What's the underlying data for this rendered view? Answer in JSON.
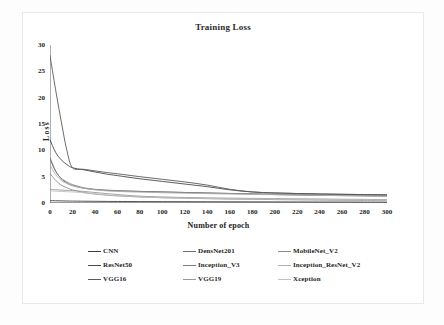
{
  "chart_data": {
    "type": "line",
    "title": "Training Loss",
    "xlabel": "Number of epoch",
    "ylabel": "Loss",
    "xlim": [
      0,
      300
    ],
    "ylim": [
      0,
      30
    ],
    "xticks": [
      "0",
      "20",
      "40",
      "60",
      "80",
      "100",
      "120",
      "140",
      "160",
      "180",
      "200",
      "220",
      "240",
      "260",
      "280",
      "300"
    ],
    "yticks": [
      "0",
      "5",
      "10",
      "15",
      "20",
      "25",
      "30"
    ],
    "grid": false,
    "legend_position": "bottom",
    "x": [
      0,
      5,
      10,
      15,
      20,
      30,
      40,
      50,
      60,
      80,
      100,
      120,
      140,
      160,
      180,
      200,
      220,
      240,
      260,
      280,
      300
    ],
    "series": [
      {
        "name": "CNN",
        "color": "#3f3f3f",
        "values": [
          0.45,
          0.42,
          0.4,
          0.38,
          0.36,
          0.34,
          0.32,
          0.3,
          0.29,
          0.27,
          0.26,
          0.25,
          0.24,
          0.23,
          0.22,
          0.21,
          0.2,
          0.19,
          0.18,
          0.17,
          0.16
        ]
      },
      {
        "name": "DensNet201",
        "color": "#6e6e6e",
        "values": [
          8.6,
          6.1,
          4.6,
          3.8,
          3.3,
          2.8,
          2.55,
          2.4,
          2.3,
          2.2,
          2.1,
          2.0,
          1.9,
          1.8,
          1.7,
          1.6,
          1.5,
          1.45,
          1.4,
          1.35,
          1.3
        ]
      },
      {
        "name": "MobileNet_V2",
        "color": "#8a8a8a",
        "values": [
          5.6,
          4.3,
          3.4,
          2.9,
          2.5,
          2.0,
          1.7,
          1.5,
          1.35,
          1.15,
          1.0,
          0.9,
          0.82,
          0.75,
          0.7,
          0.65,
          0.6,
          0.56,
          0.52,
          0.48,
          0.45
        ]
      },
      {
        "name": "ResNet50",
        "color": "#4a4a4a",
        "values": [
          12.0,
          9.6,
          8.2,
          7.3,
          6.7,
          6.3,
          5.9,
          5.5,
          5.2,
          4.6,
          4.1,
          3.6,
          3.1,
          2.5,
          2.1,
          1.9,
          1.8,
          1.7,
          1.65,
          1.6,
          1.55
        ]
      },
      {
        "name": "Inception_V3",
        "color": "#7d7d7d",
        "values": [
          8.3,
          6.0,
          4.7,
          4.0,
          3.5,
          2.9,
          2.6,
          2.45,
          2.35,
          2.2,
          2.1,
          2.0,
          1.9,
          1.82,
          1.75,
          1.68,
          1.6,
          1.54,
          1.48,
          1.42,
          1.36
        ]
      },
      {
        "name": "Inception_ResNet_V2",
        "color": "#b0b0b0",
        "values": [
          7.2,
          5.4,
          4.3,
          3.7,
          3.3,
          2.8,
          2.5,
          2.3,
          2.2,
          2.05,
          1.95,
          1.85,
          1.78,
          1.7,
          1.64,
          1.58,
          1.52,
          1.46,
          1.4,
          1.35,
          1.3
        ]
      },
      {
        "name": "VGG16",
        "color": "#5a5a5a",
        "values": [
          28.0,
          21.5,
          15.5,
          10.0,
          6.7,
          6.4,
          6.1,
          5.8,
          5.55,
          5.0,
          4.5,
          4.0,
          3.4,
          2.6,
          2.1,
          1.9,
          1.8,
          1.72,
          1.65,
          1.6,
          1.55
        ]
      },
      {
        "name": "VGG19",
        "color": "#999999",
        "values": [
          2.6,
          2.5,
          2.45,
          2.4,
          2.35,
          2.2,
          2.0,
          1.8,
          1.6,
          1.3,
          1.15,
          1.05,
          0.98,
          0.92,
          0.88,
          0.84,
          0.8,
          0.76,
          0.72,
          0.68,
          0.65
        ]
      },
      {
        "name": "Xception",
        "color": "#c2c2c2",
        "values": [
          2.3,
          2.25,
          2.2,
          2.15,
          2.1,
          1.95,
          1.75,
          1.55,
          1.4,
          1.15,
          1.0,
          0.92,
          0.86,
          0.8,
          0.76,
          0.72,
          0.68,
          0.64,
          0.6,
          0.56,
          0.52
        ]
      }
    ]
  },
  "legend": {
    "items": [
      {
        "label": "CNN"
      },
      {
        "label": "DensNet201"
      },
      {
        "label": "MobileNet_V2"
      },
      {
        "label": "ResNet50"
      },
      {
        "label": "Inception_V3"
      },
      {
        "label": "Inception_ResNet_V2"
      },
      {
        "label": "VGG16"
      },
      {
        "label": "VGG19"
      },
      {
        "label": "Xception"
      }
    ]
  }
}
